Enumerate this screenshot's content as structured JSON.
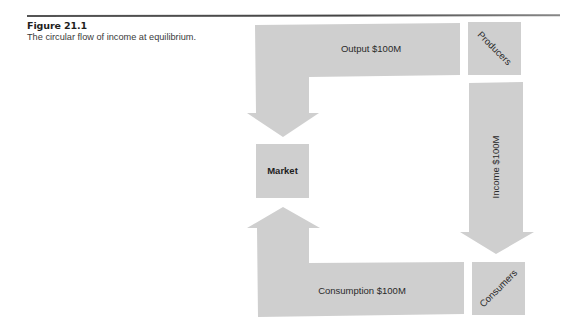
{
  "figure": {
    "label": "Figure 21.1",
    "caption": "The circular flow of income at equilibrium."
  },
  "diagram": {
    "fill_color": "#cfcfcf",
    "nodes": {
      "producers": "Producers",
      "consumers": "Consumers",
      "market": "Market"
    },
    "flows": {
      "output": "Output $100M",
      "income": "Income $100M",
      "consumption": "Consumption $100M"
    },
    "flow_directions": [
      {
        "from": "Producers",
        "to": "Market",
        "label": "Output $100M"
      },
      {
        "from": "Producers",
        "to": "Consumers",
        "label": "Income $100M"
      },
      {
        "from": "Consumers",
        "to": "Market",
        "label": "Consumption $100M"
      }
    ]
  }
}
